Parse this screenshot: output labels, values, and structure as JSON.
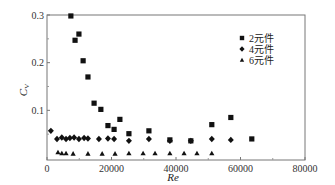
{
  "chart_data": {
    "type": "scatter",
    "title": "",
    "xlabel": "Re",
    "ylabel": "C_V",
    "ylabel_main": "C",
    "ylabel_sub": "V",
    "xlim": [
      0,
      80000
    ],
    "ylim": [
      0,
      0.3
    ],
    "xticks": [
      "0",
      "20000",
      "40000",
      "60000",
      "80000"
    ],
    "yticks": [
      "0.1",
      "0.2",
      "0.3"
    ],
    "grid": false,
    "legend_position": "upper right",
    "series": [
      {
        "name": "2元件",
        "marker": "square",
        "points": [
          [
            7400,
            0.298
          ],
          [
            9900,
            0.26
          ],
          [
            8700,
            0.247
          ],
          [
            11200,
            0.204
          ],
          [
            12700,
            0.17
          ],
          [
            14600,
            0.115
          ],
          [
            16700,
            0.102
          ],
          [
            18900,
            0.068
          ],
          [
            20800,
            0.06
          ],
          [
            22600,
            0.081
          ],
          [
            25400,
            0.051
          ],
          [
            31600,
            0.057
          ],
          [
            38100,
            0.038
          ],
          [
            44600,
            0.036
          ],
          [
            51100,
            0.07
          ],
          [
            57000,
            0.085
          ],
          [
            63500,
            0.04
          ]
        ]
      },
      {
        "name": "4元件",
        "marker": "diamond",
        "points": [
          [
            1200,
            0.057
          ],
          [
            3100,
            0.04
          ],
          [
            4600,
            0.043
          ],
          [
            5900,
            0.04
          ],
          [
            7100,
            0.042
          ],
          [
            8400,
            0.043
          ],
          [
            9900,
            0.04
          ],
          [
            11500,
            0.042
          ],
          [
            12700,
            0.041
          ],
          [
            16100,
            0.04
          ],
          [
            18900,
            0.041
          ],
          [
            20800,
            0.04
          ],
          [
            25400,
            0.036
          ],
          [
            31600,
            0.04
          ],
          [
            38100,
            0.036
          ],
          [
            44600,
            0.036
          ],
          [
            51100,
            0.04
          ],
          [
            57000,
            0.038
          ]
        ]
      },
      {
        "name": "6元件",
        "marker": "triangle",
        "points": [
          [
            3400,
            0.012
          ],
          [
            4600,
            0.01
          ],
          [
            5900,
            0.01
          ],
          [
            8100,
            0.009
          ],
          [
            12700,
            0.009
          ],
          [
            17100,
            0.009
          ],
          [
            21100,
            0.009
          ],
          [
            25400,
            0.01
          ],
          [
            29800,
            0.01
          ],
          [
            33500,
            0.01
          ],
          [
            38100,
            0.01
          ],
          [
            42500,
            0.01
          ],
          [
            46500,
            0.01
          ],
          [
            51100,
            0.01
          ]
        ]
      }
    ]
  }
}
